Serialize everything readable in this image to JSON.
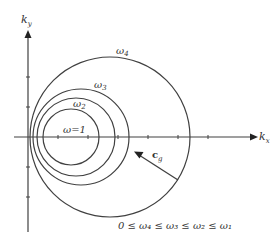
{
  "diagram": {
    "axes": {
      "x_label": "k",
      "x_label_sub": "x",
      "y_label": "k",
      "y_label_sub": "y"
    },
    "curves": [
      {
        "id": "omega1",
        "label": "ω=1"
      },
      {
        "id": "omega2",
        "label": "ω",
        "sub": "2"
      },
      {
        "id": "omega3",
        "label": "ω",
        "sub": "3"
      },
      {
        "id": "omega4",
        "label": "ω",
        "sub": "4"
      }
    ],
    "vector": {
      "label": "c",
      "sub": "g"
    },
    "inequality": {
      "text": "0 ≤ ω₄ ≤ ω₃ ≤ ω₂ ≤ ω₁"
    },
    "colors": {
      "stroke": "#404040",
      "background": "#ffffff"
    }
  }
}
